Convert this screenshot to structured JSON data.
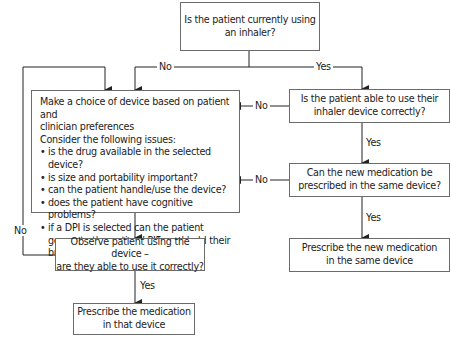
{
  "nodes": {
    "start": {
      "lines": [
        "Is the patient currently using",
        "an inhaler?"
      ]
    },
    "choose_device": {
      "intro": [
        "Make a choice of device based on patient and",
        "clinician preferences"
      ],
      "consider": "Consider the following issues:",
      "issues": [
        "is the drug available in the selected device?",
        "is size and portability important?",
        "can the patient handle/use the device?",
        "does the patient have cognitive problems?",
        "if a DPI is selected can the patient generate the optimal PIFr and hold their breath?"
      ]
    },
    "able_to_use": {
      "lines": [
        "Is the patient able to use their",
        "inhaler device correctly?"
      ]
    },
    "same_device": {
      "lines": [
        "Can the new medication be",
        "prescribed in the same device?"
      ]
    },
    "prescribe_same": {
      "lines": [
        "Prescribe the new medication",
        "in the same device"
      ]
    },
    "observe": {
      "lines": [
        "Observe patient using the device –",
        "are they able to use it correctly?"
      ]
    },
    "prescribe_that": {
      "lines": [
        "Prescribe the medication",
        "in that device"
      ]
    }
  },
  "edges": {
    "start_no": "No",
    "start_yes": "Yes",
    "able_no": "No",
    "able_yes": "Yes",
    "same_no": "No",
    "same_yes": "Yes",
    "observe_no": "No",
    "observe_yes": "Yes"
  },
  "colors": {
    "line": "#222222",
    "box_border": "#6b6b6b",
    "text": "#222222"
  }
}
